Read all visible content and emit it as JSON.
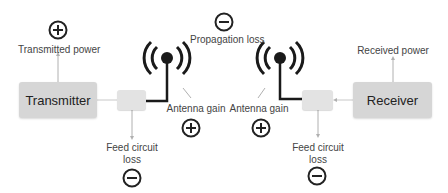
{
  "diagram": {
    "transmitter": {
      "label": "Transmitted power",
      "block": "Transmitter",
      "sign": "plus"
    },
    "tx_feed": {
      "label_line1": "Feed circuit",
      "label_line2": "loss",
      "sign": "minus"
    },
    "tx_antenna": {
      "label": "Antenna gain",
      "sign": "plus"
    },
    "propagation": {
      "label": "Propagation loss",
      "sign": "minus"
    },
    "rx_antenna": {
      "label": "Antenna gain",
      "sign": "plus"
    },
    "rx_feed": {
      "label_line1": "Feed circuit",
      "label_line2": "loss",
      "sign": "minus"
    },
    "receiver": {
      "label": "Received power",
      "block": "Receiver"
    },
    "colors": {
      "block": "#d6d6d6",
      "feed_block": "#e3e3e3",
      "antenna": "#1a1a1a",
      "arrow": "#aaaaaa",
      "sign": "#222222"
    }
  }
}
